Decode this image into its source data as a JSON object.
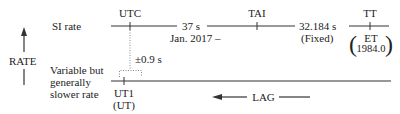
{
  "diagram": {
    "rate_axis": {
      "label": "RATE",
      "arrow_direction": "up"
    },
    "rows": [
      {
        "label": "SI rate"
      },
      {
        "label_lines": [
          "Variable but",
          "generally",
          "slower rate"
        ]
      }
    ],
    "scales": {
      "utc": {
        "label": "UTC"
      },
      "tai": {
        "label": "TAI"
      },
      "tt": {
        "label": "TT",
        "alt_label": "ET",
        "alt_year": "1984.0"
      },
      "ut1": {
        "label": "UT1",
        "alt_label": "(UT)"
      }
    },
    "offsets": {
      "utc_tai": {
        "value": "37 s",
        "note": "Jan. 2017 –"
      },
      "tai_tt": {
        "value": "32.184 s",
        "note": "(Fixed)"
      },
      "utc_ut1": {
        "value": "±0.9 s"
      }
    },
    "lag": {
      "label": "LAG",
      "arrow_direction": "left"
    },
    "colors": {
      "line": "#333333",
      "text": "#222222",
      "dotted": "#888888"
    }
  }
}
